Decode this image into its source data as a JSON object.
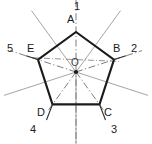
{
  "figure": {
    "background_color": "#ffffff",
    "outline_color": "#1b1b1b",
    "axis_color": "#6e6e6e",
    "thin_line_color": "#8a8a8a",
    "label_color": "#1a1a1a",
    "width": 152,
    "height": 144
  },
  "center": {
    "label": "O",
    "x": 76,
    "y": 72,
    "dot_radius": 2
  },
  "vertices": [
    {
      "id": "A",
      "label": "A",
      "number": "1",
      "x": 76,
      "y": 32,
      "label_x": 68,
      "label_y": 16,
      "number_x": 72,
      "number_y": 0
    },
    {
      "id": "B",
      "label": "B",
      "number": "2",
      "x": 114.0,
      "y": 59.6,
      "label_x": 113,
      "label_y": 45,
      "number_x": 131,
      "number_y": 44
    },
    {
      "id": "C",
      "label": "C",
      "number": "3",
      "x": 99.5,
      "y": 104.4,
      "label_x": 105,
      "label_y": 110,
      "number_x": 112,
      "number_y": 127
    },
    {
      "id": "D",
      "label": "D",
      "number": "4",
      "x": 52.5,
      "y": 104.4,
      "label_x": 37,
      "label_y": 110,
      "number_x": 29,
      "number_y": 127
    },
    {
      "id": "E",
      "label": "E",
      "number": "5",
      "x": 38.0,
      "y": 59.6,
      "label_x": 27,
      "label_y": 45,
      "number_x": 8,
      "number_y": 44
    }
  ],
  "edges": [
    {
      "from": "A",
      "to": "B"
    },
    {
      "from": "B",
      "to": "C"
    },
    {
      "from": "C",
      "to": "D"
    },
    {
      "from": "D",
      "to": "E"
    },
    {
      "from": "E",
      "to": "A"
    }
  ],
  "axes": [
    {
      "name": "axis-vertical-A",
      "angle_deg": 90,
      "style": "dash-dot",
      "extends_outside": true
    },
    {
      "name": "axis-to-B",
      "angle_deg": 18,
      "style": "dash-dot",
      "extends_outside": true
    },
    {
      "name": "axis-to-C",
      "angle_deg": 306,
      "style": "dash-dot",
      "extends_outside": false
    },
    {
      "name": "axis-to-D",
      "angle_deg": 234,
      "style": "dash-dot",
      "extends_outside": false
    },
    {
      "name": "axis-to-E",
      "angle_deg": 162,
      "style": "dash-dot",
      "extends_outside": true
    }
  ],
  "midpoint_rays": [
    {
      "name": "ray-mid-AB",
      "angle_deg": 54,
      "extends_outside": true
    },
    {
      "name": "ray-mid-EA",
      "angle_deg": 126,
      "extends_outside": true
    },
    {
      "name": "ray-mid-DE",
      "angle_deg": 198,
      "extends_outside": true
    },
    {
      "name": "ray-mid-CD",
      "angle_deg": 270,
      "extends_outside": true
    },
    {
      "name": "ray-mid-BC",
      "angle_deg": 342,
      "extends_outside": true
    }
  ]
}
